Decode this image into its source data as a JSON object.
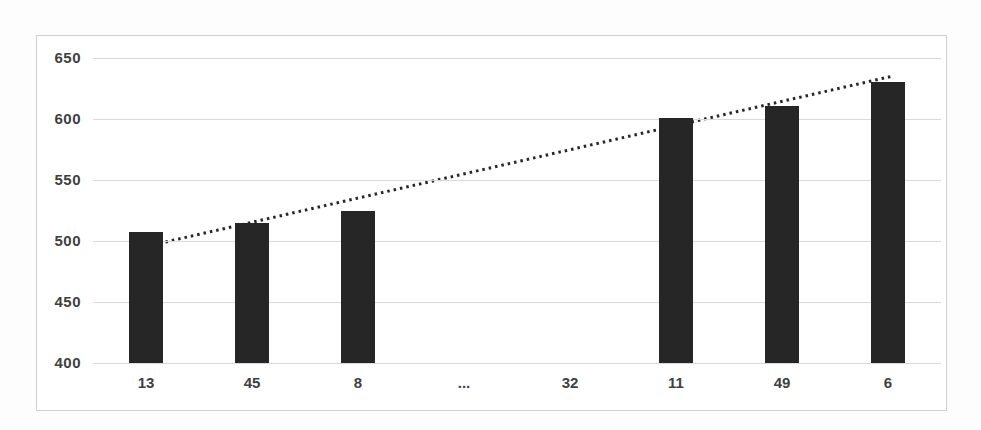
{
  "chart_data": {
    "type": "bar",
    "title": "",
    "xlabel": "",
    "ylabel": "",
    "categories": [
      "13",
      "45",
      "8",
      "...",
      "32",
      "11",
      "49",
      "6"
    ],
    "values": [
      507,
      515,
      525,
      null,
      null,
      601,
      611,
      630
    ],
    "ylim": [
      400,
      650
    ],
    "yticks": [
      400,
      450,
      500,
      550,
      600,
      650
    ],
    "grid": true,
    "legend": "none",
    "colors": {
      "bar": "#262626",
      "gridline": "#d9d9d9",
      "tick_label": "#3f3f3f",
      "frame_border": "#cfcfcf",
      "background": "#ffffff",
      "trendline": "#262626"
    },
    "trendline": {
      "style": "dotted",
      "color": "#262626",
      "start_frac": 0.078,
      "start_value": 498,
      "end_frac": 0.942,
      "end_value": 635
    }
  }
}
